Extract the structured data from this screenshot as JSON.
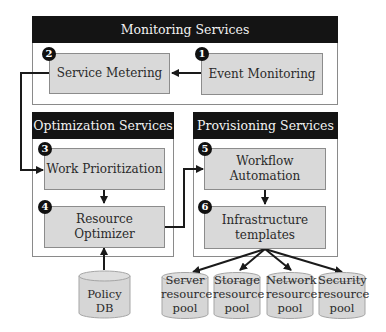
{
  "diagram": {
    "groups": [
      {
        "id": "monitoring",
        "title": "Monitoring Services"
      },
      {
        "id": "optimization",
        "title": "Optimization Services"
      },
      {
        "id": "provisioning",
        "title": "Provisioning Services"
      }
    ],
    "nodes": [
      {
        "id": "event-monitoring",
        "step": "1",
        "label": "Event Monitoring"
      },
      {
        "id": "service-metering",
        "step": "2",
        "label": "Service Metering"
      },
      {
        "id": "work-prioritization",
        "step": "3",
        "label": "Work Prioritization"
      },
      {
        "id": "resource-optimizer",
        "step": "4",
        "label": "Resource Optimizer"
      },
      {
        "id": "workflow-automation",
        "step": "5",
        "label": "Workflow Automation"
      },
      {
        "id": "infrastructure-templates",
        "step": "6",
        "label_line1": "Infrastructure",
        "label_line2": "templates"
      }
    ],
    "datastores": [
      {
        "id": "policy-db",
        "line1": "Policy",
        "line2": "DB"
      },
      {
        "id": "server-pool",
        "line1": "Server",
        "line2": "resource",
        "line3": "pool"
      },
      {
        "id": "storage-pool",
        "line1": "Storage",
        "line2": "resource",
        "line3": "pool"
      },
      {
        "id": "network-pool",
        "line1": "Network",
        "line2": "resource",
        "line3": "pool"
      },
      {
        "id": "security-pool",
        "line1": "Security",
        "line2": "resource",
        "line3": "pool"
      }
    ],
    "edges": [
      {
        "from": "event-monitoring",
        "to": "service-metering"
      },
      {
        "from": "service-metering",
        "to": "work-prioritization"
      },
      {
        "from": "work-prioritization",
        "to": "resource-optimizer"
      },
      {
        "from": "policy-db",
        "to": "resource-optimizer"
      },
      {
        "from": "resource-optimizer",
        "to": "workflow-automation"
      },
      {
        "from": "workflow-automation",
        "to": "infrastructure-templates"
      },
      {
        "from": "infrastructure-templates",
        "to": "server-pool"
      },
      {
        "from": "infrastructure-templates",
        "to": "storage-pool"
      },
      {
        "from": "infrastructure-templates",
        "to": "network-pool"
      },
      {
        "from": "infrastructure-templates",
        "to": "security-pool"
      }
    ],
    "colors": {
      "header": "#141414",
      "node_fill": "#d9d9d9",
      "badge": "#111111",
      "line": "#1a1a1a"
    }
  }
}
